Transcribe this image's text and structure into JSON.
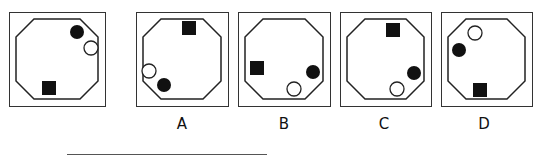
{
  "question": {
    "stem": {
      "box": {
        "x": 9,
        "y": 12,
        "w": 97,
        "h": 95
      },
      "shapes": [
        {
          "type": "filled-circle",
          "cx": 67,
          "cy": 19,
          "r": 7
        },
        {
          "type": "open-circle",
          "cx": 81,
          "cy": 35,
          "r": 7
        },
        {
          "type": "filled-square",
          "x": 32,
          "y": 68,
          "s": 14
        }
      ]
    },
    "options": [
      {
        "label": "A",
        "box": {
          "x": 136,
          "y": 12,
          "w": 93,
          "h": 95
        },
        "shapes": [
          {
            "type": "filled-square",
            "x": 45,
            "y": 8,
            "s": 14
          },
          {
            "type": "open-circle",
            "cx": 12,
            "cy": 58,
            "r": 7
          },
          {
            "type": "filled-circle",
            "cx": 27,
            "cy": 72,
            "r": 7
          }
        ]
      },
      {
        "label": "B",
        "box": {
          "x": 238,
          "y": 12,
          "w": 93,
          "h": 95
        },
        "shapes": [
          {
            "type": "filled-square",
            "x": 11,
            "y": 48,
            "s": 14
          },
          {
            "type": "filled-circle",
            "cx": 74,
            "cy": 59,
            "r": 7
          },
          {
            "type": "open-circle",
            "cx": 55,
            "cy": 76,
            "r": 7
          }
        ]
      },
      {
        "label": "C",
        "box": {
          "x": 340,
          "y": 12,
          "w": 92,
          "h": 95
        },
        "shapes": [
          {
            "type": "filled-square",
            "x": 45,
            "y": 10,
            "s": 14
          },
          {
            "type": "filled-circle",
            "cx": 73,
            "cy": 60,
            "r": 7
          },
          {
            "type": "open-circle",
            "cx": 56,
            "cy": 76,
            "r": 7
          }
        ]
      },
      {
        "label": "D",
        "box": {
          "x": 441,
          "y": 12,
          "w": 92,
          "h": 95
        },
        "shapes": [
          {
            "type": "open-circle",
            "cx": 33,
            "cy": 20,
            "r": 7
          },
          {
            "type": "filled-circle",
            "cx": 17,
            "cy": 37,
            "r": 7
          },
          {
            "type": "filled-square",
            "x": 31,
            "y": 70,
            "s": 14
          }
        ]
      }
    ]
  },
  "labels": {
    "a": "A",
    "b": "B",
    "c": "C",
    "d": "D"
  },
  "colors": {
    "stroke": "#222222",
    "fill": "#111111",
    "frame": "#333333"
  }
}
